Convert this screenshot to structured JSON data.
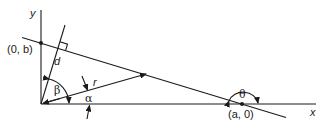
{
  "figure": {
    "labels": {
      "y_axis": "y",
      "x_axis": "x",
      "point_y_intercept": "(0, b)",
      "point_x_intercept": "(a, 0)",
      "distance": "d",
      "radius": "r",
      "angle_beta": "β",
      "angle_alpha": "α",
      "angle_theta": "θ"
    },
    "colors": {
      "stroke": "#1a1a1a",
      "background": "#ffffff"
    }
  }
}
